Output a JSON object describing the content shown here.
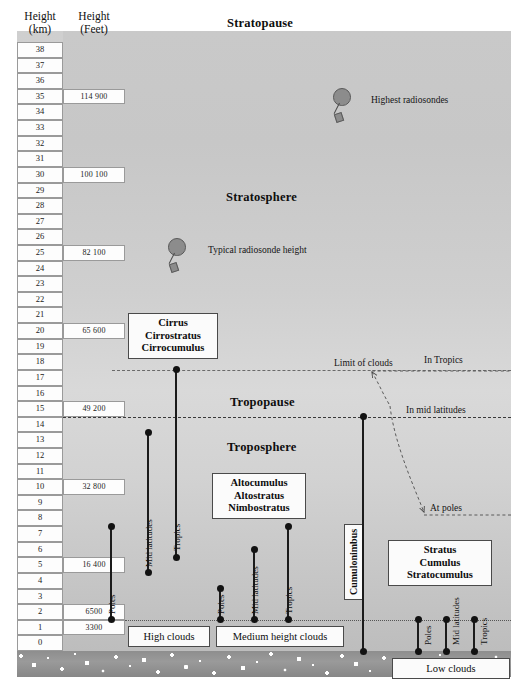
{
  "headers": {
    "km": {
      "line1": "Height",
      "line2": "(km)"
    },
    "feet": {
      "line1": "Height",
      "line2": "(Feet)"
    }
  },
  "scale": {
    "km_ticks": [
      38,
      37,
      36,
      35,
      34,
      33,
      32,
      31,
      30,
      29,
      28,
      27,
      26,
      25,
      24,
      23,
      22,
      21,
      20,
      19,
      18,
      17,
      16,
      15,
      14,
      13,
      12,
      11,
      10,
      9,
      8,
      7,
      6,
      5,
      4,
      3,
      2,
      1,
      0
    ],
    "feet_labels": [
      {
        "km": 35,
        "text": "114 900"
      },
      {
        "km": 30,
        "text": "100 100"
      },
      {
        "km": 25,
        "text": "82 100"
      },
      {
        "km": 20,
        "text": "65 600"
      },
      {
        "km": 15,
        "text": "49 200"
      },
      {
        "km": 10,
        "text": "32 800"
      },
      {
        "km": 5,
        "text": "16 400"
      },
      {
        "km": 2,
        "text": "6500"
      },
      {
        "km": 1,
        "text": "3300"
      }
    ]
  },
  "layers": {
    "stratopause": "Stratopause",
    "stratosphere": "Stratosphere",
    "tropopause": "Tropopause",
    "troposphere": "Troposphere"
  },
  "annotations": {
    "limit_of_clouds": "Limit of clouds",
    "in_tropics": "In Tropics",
    "in_mid_latitudes": "In mid latitudes",
    "at_poles": "At poles",
    "highest_radiosondes": "Highest radiosondes",
    "typical_radiosonde": "Typical radiosonde height"
  },
  "cloud_groups": {
    "high": {
      "box": {
        "lines": [
          "Cirrus",
          "Cirrostratus",
          "Cirrocumulus"
        ]
      },
      "footer": "High clouds",
      "bars": [
        {
          "label": "Poles",
          "top_km": 8,
          "bottom_km": 2
        },
        {
          "label": "Mid latitudes",
          "top_km": 14,
          "bottom_km": 5
        },
        {
          "label": "Tropics",
          "top_km": 18,
          "bottom_km": 6
        }
      ]
    },
    "medium": {
      "box": {
        "lines": [
          "Altocumulus",
          "Altostratus",
          "Nimbostratus"
        ]
      },
      "footer": "Medium height clouds",
      "bars": [
        {
          "label": "Poles",
          "top_km": 4,
          "bottom_km": 2
        },
        {
          "label": "Mid latitudes",
          "top_km": 6.5,
          "bottom_km": 2
        },
        {
          "label": "Tropics",
          "top_km": 8,
          "bottom_km": 2
        }
      ]
    },
    "low": {
      "box": {
        "lines": [
          "Stratus",
          "Cumulus",
          "Stratocumulus"
        ]
      },
      "footer": "Low clouds",
      "bars": [
        {
          "label": "Poles",
          "top_km": 2,
          "bottom_km": 0
        },
        {
          "label": "Mid latitudes",
          "top_km": 2,
          "bottom_km": 0
        },
        {
          "label": "Tropics",
          "top_km": 2,
          "bottom_km": 0
        }
      ]
    },
    "cumulonimbus": {
      "label": "Cumulonimbus",
      "top_km": 15,
      "bottom_km": 0
    }
  },
  "chart_data": {
    "type": "bar",
    "ylabel": "Height (km)",
    "ylabel_secondary": "Height (Feet)",
    "ylim": [
      0,
      38
    ],
    "grid": false,
    "legend": "none",
    "axis_conversion": [
      {
        "km": 35,
        "feet": 114900
      },
      {
        "km": 30,
        "feet": 100100
      },
      {
        "km": 25,
        "feet": 82100
      },
      {
        "km": 20,
        "feet": 65600
      },
      {
        "km": 15,
        "feet": 49200
      },
      {
        "km": 10,
        "feet": 32800
      },
      {
        "km": 5,
        "feet": 16400
      },
      {
        "km": 2,
        "feet": 6500
      },
      {
        "km": 1,
        "feet": 3300
      }
    ],
    "reference_levels": [
      {
        "name": "Stratopause",
        "km": 38
      },
      {
        "name": "Limit of clouds",
        "km": 18
      },
      {
        "name": "Tropopause (In Tropics)",
        "km": 18
      },
      {
        "name": "Tropopause (In mid latitudes)",
        "km": 15
      },
      {
        "name": "Tropopause (At poles)",
        "km": 8
      },
      {
        "name": "Cloud base reference",
        "km": 2
      }
    ],
    "series": [
      {
        "name": "High clouds — Poles",
        "top_km": 8,
        "bottom_km": 2
      },
      {
        "name": "High clouds — Mid latitudes",
        "top_km": 14,
        "bottom_km": 5
      },
      {
        "name": "High clouds — Tropics",
        "top_km": 18,
        "bottom_km": 6
      },
      {
        "name": "Medium clouds — Poles",
        "top_km": 4,
        "bottom_km": 2
      },
      {
        "name": "Medium clouds — Mid latitudes",
        "top_km": 6.5,
        "bottom_km": 2
      },
      {
        "name": "Medium clouds — Tropics",
        "top_km": 8,
        "bottom_km": 2
      },
      {
        "name": "Low clouds — Poles",
        "top_km": 2,
        "bottom_km": 0
      },
      {
        "name": "Low clouds — Mid latitudes",
        "top_km": 2,
        "bottom_km": 0
      },
      {
        "name": "Low clouds — Tropics",
        "top_km": 2,
        "bottom_km": 0
      },
      {
        "name": "Cumulonimbus",
        "top_km": 15,
        "bottom_km": 0
      }
    ],
    "point_markers": [
      {
        "name": "Highest radiosondes",
        "km": 35
      },
      {
        "name": "Typical radiosonde height",
        "km": 25
      }
    ]
  }
}
